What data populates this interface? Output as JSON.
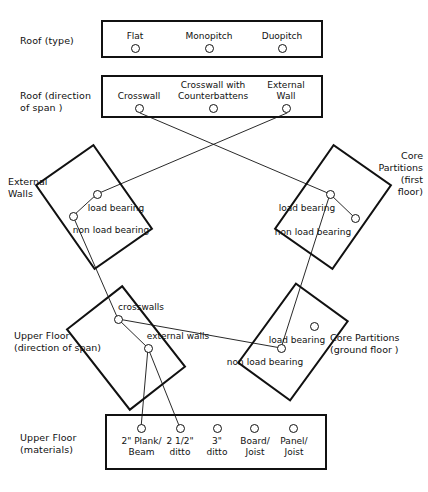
{
  "diagram": {
    "title_present": false,
    "rows": [
      {
        "id": "roof-type",
        "label": "Roof (type)",
        "kind": "horizontal-box",
        "options": [
          {
            "label": "Flat"
          },
          {
            "label": "Monopitch"
          },
          {
            "label": "Duopitch"
          }
        ]
      },
      {
        "id": "roof-direction-of-span",
        "label": "Roof (direction\nof span )",
        "kind": "horizontal-box",
        "options": [
          {
            "label": "Crosswall"
          },
          {
            "label": "Crosswall with\nCounterbattens"
          },
          {
            "label": "External\nWall"
          }
        ]
      },
      {
        "id": "external-walls",
        "label": "External\nWalls",
        "kind": "rotated-box",
        "options": [
          {
            "label": "load bearing"
          },
          {
            "label": "non load bearing"
          }
        ]
      },
      {
        "id": "core-partitions-first-floor",
        "label": "Core\nPartitions\n(first\nfloor)",
        "kind": "rotated-box",
        "options": [
          {
            "label": "load bearing"
          },
          {
            "label": "non load bearing"
          }
        ]
      },
      {
        "id": "upper-floor-direction-of-span",
        "label": "Upper Floor\n(direction of span)",
        "kind": "rotated-box",
        "options": [
          {
            "label": "crosswalls"
          },
          {
            "label": "external walls"
          }
        ]
      },
      {
        "id": "core-partitions-ground-floor",
        "label": "Core Partitions\n(ground floor )",
        "kind": "rotated-box",
        "options": [
          {
            "label": "load bearing"
          },
          {
            "label": "non load bearing"
          }
        ]
      },
      {
        "id": "upper-floor-materials",
        "label": "Upper Floor\n(materials)",
        "kind": "horizontal-box",
        "options": [
          {
            "label": "2\" Plank/\nBeam"
          },
          {
            "label": "2 1/2\"\nditto"
          },
          {
            "label": "3\"\nditto"
          },
          {
            "label": "Board/\nJoist"
          },
          {
            "label": "Panel/\nJoist"
          }
        ]
      }
    ],
    "colors": {
      "ink": "#111111",
      "paper": "#ffffff"
    }
  }
}
